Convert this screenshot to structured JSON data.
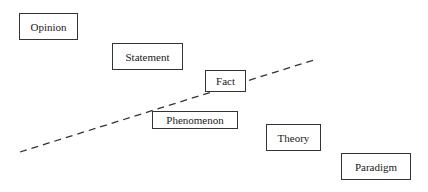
{
  "diagram": {
    "type": "hierarchy-of-knowledge",
    "divider": {
      "style": "dashed",
      "from": [
        20,
        152
      ],
      "to": [
        314,
        60
      ]
    },
    "nodes": [
      {
        "id": "opinion",
        "label": "Opinion",
        "box": [
          19,
          13,
          59,
          27
        ]
      },
      {
        "id": "statement",
        "label": "Statement",
        "box": [
          112,
          43,
          71,
          27
        ]
      },
      {
        "id": "fact",
        "label": "Fact",
        "box": [
          205,
          70,
          41,
          22
        ]
      },
      {
        "id": "phenomenon",
        "label": "Phenomenon",
        "box": [
          152,
          111,
          86,
          18
        ]
      },
      {
        "id": "theory",
        "label": "Theory",
        "box": [
          266,
          124,
          55,
          27
        ]
      },
      {
        "id": "paradigm",
        "label": "Paradigm",
        "box": [
          341,
          153,
          70,
          27
        ]
      }
    ]
  }
}
